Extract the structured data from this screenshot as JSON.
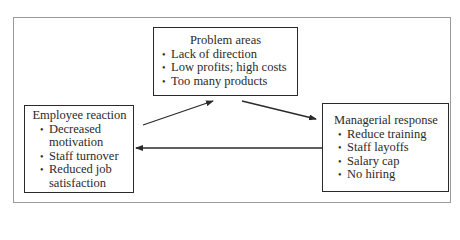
{
  "diagram": {
    "type": "cycle",
    "nodes": {
      "problem": {
        "title": "Problem areas",
        "items": [
          "Lack of direction",
          "Low profits; high costs",
          "Too many products"
        ]
      },
      "employee": {
        "title": "Employee reaction",
        "items": [
          "Decreased motivation",
          "Staff turnover",
          "Reduced job satisfaction"
        ]
      },
      "managerial": {
        "title": "Managerial response",
        "items": [
          "Reduce training",
          "Staff layoffs",
          "Salary cap",
          "No hiring"
        ]
      }
    },
    "edges": [
      {
        "from": "employee",
        "to": "problem"
      },
      {
        "from": "problem",
        "to": "managerial"
      },
      {
        "from": "managerial",
        "to": "employee"
      }
    ],
    "colors": {
      "line": "#2a2a2a",
      "frame": "#9a9a9a",
      "background": "#ffffff"
    }
  }
}
